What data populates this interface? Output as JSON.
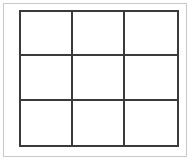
{
  "figure": {
    "kind": "grid-diagram",
    "title": "",
    "width": 193,
    "height": 161,
    "background_color": "#ffffff"
  },
  "outer_frame": {
    "present": true,
    "color": "#c8c8c8",
    "thickness": 1
  },
  "board": {
    "rows": 3,
    "columns": 3,
    "line_color": "#3a3a3a",
    "line_thickness": 2,
    "cell_background": "#ffffff",
    "cells": [
      {
        "id": "r1c1",
        "row": 1,
        "column": 1,
        "mark": ""
      },
      {
        "id": "r1c2",
        "row": 1,
        "column": 2,
        "mark": ""
      },
      {
        "id": "r1c3",
        "row": 1,
        "column": 3,
        "mark": ""
      },
      {
        "id": "r2c1",
        "row": 2,
        "column": 1,
        "mark": ""
      },
      {
        "id": "r2c2",
        "row": 2,
        "column": 2,
        "mark": ""
      },
      {
        "id": "r2c3",
        "row": 2,
        "column": 3,
        "mark": ""
      },
      {
        "id": "r3c1",
        "row": 3,
        "column": 1,
        "mark": ""
      },
      {
        "id": "r3c2",
        "row": 3,
        "column": 2,
        "mark": ""
      },
      {
        "id": "r3c3",
        "row": 3,
        "column": 3,
        "mark": ""
      }
    ]
  }
}
